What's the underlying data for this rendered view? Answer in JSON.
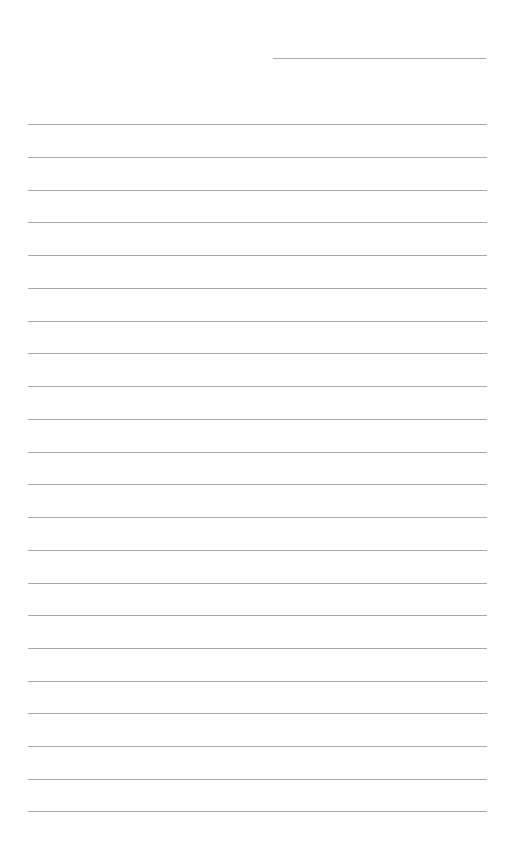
{
  "page": {
    "type": "lined-paper",
    "background_color": "#ffffff",
    "line_color": "#a8a8a8",
    "header_line": {
      "x_start": 273,
      "x_end": 486,
      "y": 59
    },
    "ruled_lines": {
      "count": 22,
      "x_start": 28,
      "x_end": 487,
      "y_positions": [
        125,
        158,
        191,
        223,
        256,
        289,
        322,
        354,
        387,
        420,
        453,
        485,
        518,
        551,
        584,
        616,
        649,
        682,
        714,
        747,
        780,
        812
      ]
    }
  }
}
